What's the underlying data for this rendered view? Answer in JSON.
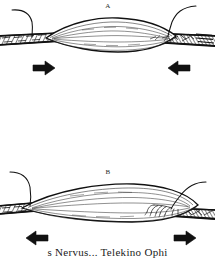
{
  "figure": {
    "background_color": "#ffffff",
    "ink_color": "#111111",
    "panels": [
      {
        "id": "A",
        "label": "A",
        "state": "contracted",
        "description": "Short thick spindle-shaped muscle belly between two hatched tendon-bone attachments, nerve entering each end",
        "arrows": [
          {
            "name": "arrow-left-a",
            "direction": "right",
            "glyph": "➡"
          },
          {
            "name": "arrow-right-a",
            "direction": "left",
            "glyph": "⬅"
          }
        ]
      },
      {
        "id": "B",
        "label": "B",
        "state": "stretched",
        "description": "Long slender elongated muscle belly between two attachments, nerve arborizing into the right end",
        "arrows": [
          {
            "name": "arrow-left-b",
            "direction": "left",
            "glyph": "⬅"
          },
          {
            "name": "arrow-right-b",
            "direction": "right",
            "glyph": "➡"
          }
        ]
      }
    ],
    "parts": {
      "muscle_belly": "muscle-belly",
      "tendon": "tendon-attachment",
      "nerve": "nerve-fiber",
      "nerve_branches": "nerve-branching"
    }
  },
  "caption": {
    "text": "s Nervus... Telekino  Ophi"
  }
}
